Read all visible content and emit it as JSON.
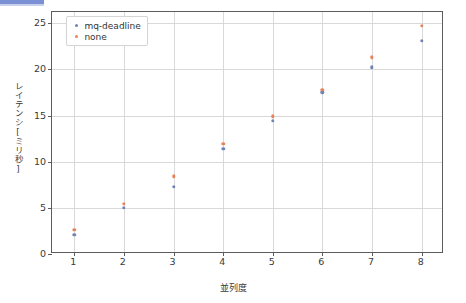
{
  "chart_data": {
    "type": "scatter",
    "title": "",
    "xlabel": "並列度",
    "ylabel": "レイテンシ[ミリ秒]",
    "x": [
      1,
      2,
      3,
      4,
      5,
      6,
      7,
      8
    ],
    "xticks": [
      "1",
      "2",
      "3",
      "4",
      "5",
      "6",
      "7",
      "8"
    ],
    "yticks": [
      "0",
      "5",
      "10",
      "15",
      "20",
      "25"
    ],
    "xlim": [
      0.55,
      8.45
    ],
    "ylim": [
      0,
      26.2
    ],
    "grid": true,
    "legend_position": "upper-left",
    "series": [
      {
        "name": "mq-deadline",
        "color": "#6f83b4",
        "values": [
          2.1,
          5.0,
          7.3,
          11.4,
          14.4,
          17.5,
          20.2,
          23.1
        ]
      },
      {
        "name": "none",
        "color": "#e8845c",
        "values": [
          2.6,
          5.4,
          8.4,
          11.9,
          14.9,
          17.8,
          21.3,
          24.7
        ]
      }
    ]
  },
  "legend": {
    "items": [
      {
        "label": "mq-deadline",
        "marker": "dot-marker-blue"
      },
      {
        "label": "none",
        "marker": "dot-marker-orange"
      }
    ]
  },
  "colors": {
    "series_mq_deadline": "#6f83b4",
    "series_none": "#e8845c",
    "axis": "#5c5c5c",
    "grid": "#d9d9d9",
    "background": "#ffffff",
    "top_fragment": "#7b8fd4"
  }
}
